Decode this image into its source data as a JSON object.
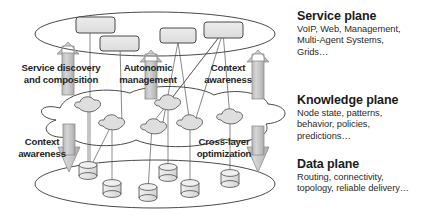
{
  "diagram": {
    "title_present": false,
    "planes": [
      {
        "id": "service-plane",
        "name": "Service plane",
        "description": "VoIP, Web, Management, Multi-Agent Systems, Grids…",
        "description_lines": [
          "VoIP, Web, Management,",
          "Multi-Agent Systems,",
          "Grids…"
        ],
        "shape": "ellipse",
        "node_count": 4,
        "node_shape": "rounded-rectangle"
      },
      {
        "id": "knowledge-plane",
        "name": "Knowledge plane",
        "description": "Node state, patterns, behavior, policies, predictions…",
        "description_lines": [
          "Node state, patterns,",
          "behavior, policies,",
          "predictions…"
        ],
        "shape": "cloud",
        "node_count": 6,
        "node_shape": "cloud"
      },
      {
        "id": "data-plane",
        "name": "Data plane",
        "description": "Routing, connectivity, topology, reliable delivery…",
        "description_lines": [
          "Routing, connectivity,",
          "topology, reliable delivery…"
        ],
        "shape": "ellipse",
        "node_count": 6,
        "node_shape": "cylinder"
      }
    ],
    "flow_arrows": [
      {
        "id": "service-discovery-and-composition",
        "label": "Service discovery and composition",
        "label_lines": [
          "Service discovery",
          "and composition"
        ],
        "direction": "up",
        "from_plane": "knowledge-plane",
        "to_plane": "service-plane"
      },
      {
        "id": "autonomic-management",
        "label": "Autonomic management",
        "label_lines": [
          "Autonomic",
          "management"
        ],
        "direction": "up",
        "from_plane": "knowledge-plane",
        "to_plane": "service-plane"
      },
      {
        "id": "context-awareness-upper",
        "label": "Context awareness",
        "label_lines": [
          "Context",
          "awareness"
        ],
        "direction": "up",
        "from_plane": "knowledge-plane",
        "to_plane": "service-plane"
      },
      {
        "id": "context-awareness-lower",
        "label": "Context awareness",
        "label_lines": [
          "Context",
          "awareness"
        ],
        "direction": "down",
        "from_plane": "knowledge-plane",
        "to_plane": "data-plane"
      },
      {
        "id": "cross-layer-optimization",
        "label": "Cross-layer optimization",
        "label_lines": [
          "Cross-layer",
          "optimization"
        ],
        "direction": "down",
        "from_plane": "knowledge-plane",
        "to_plane": "data-plane"
      }
    ],
    "colors": {
      "stroke": "#4a4a4a",
      "node_fill": "#e4e4e4",
      "arrow_fill": "#c9c9c9",
      "arrow_stroke": "#8e8e8e",
      "text": "#262626",
      "background": "#ffffff"
    }
  }
}
